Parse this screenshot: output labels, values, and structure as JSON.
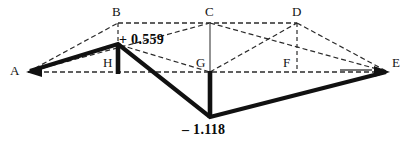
{
  "figure": {
    "width": 410,
    "height": 148,
    "background": "#ffffff",
    "stroke_solid_heavy": "#111111",
    "stroke_solid_thin": "#6f6f6f",
    "stroke_dashed": "#2b2b2b"
  },
  "nodes": [
    {
      "id": "A",
      "label": "A",
      "x": 28,
      "y": 72,
      "label_x": 10,
      "label_y": 64
    },
    {
      "id": "B",
      "label": "B",
      "x": 118,
      "y": 23,
      "label_x": 112,
      "label_y": 5
    },
    {
      "id": "C",
      "label": "C",
      "x": 210,
      "y": 23,
      "label_x": 205,
      "label_y": 5
    },
    {
      "id": "D",
      "label": "D",
      "x": 297,
      "y": 23,
      "label_x": 292,
      "label_y": 5
    },
    {
      "id": "E",
      "label": "E",
      "x": 388,
      "y": 72,
      "label_x": 392,
      "label_y": 56
    },
    {
      "id": "F",
      "label": "F",
      "x": 297,
      "y": 72,
      "label_x": 283,
      "label_y": 56
    },
    {
      "id": "G",
      "label": "G",
      "x": 210,
      "y": 72,
      "label_x": 196,
      "label_y": 56
    },
    {
      "id": "H",
      "label": "H",
      "x": 118,
      "y": 72,
      "label_x": 103,
      "label_y": 56
    }
  ],
  "ordinates": [
    {
      "id": "peak-positive",
      "text": "+ 0.559",
      "value": 0.559,
      "at_node": "H",
      "x": 118,
      "y": 44,
      "label_x": 119,
      "label_y": 33
    },
    {
      "id": "peak-negative",
      "text": "– 1.118",
      "value": -1.118,
      "at_node": "G",
      "x": 210,
      "y": 118,
      "label_x": 182,
      "label_y": 123
    }
  ],
  "series": {
    "influence_line": {
      "name": "influence line",
      "style": "solid-heavy",
      "points": [
        [
          28,
          72
        ],
        [
          118,
          44
        ],
        [
          210,
          118
        ],
        [
          388,
          72
        ]
      ]
    },
    "vertical_bars": [
      {
        "name": "bar-at-H",
        "x": 118,
        "y1": 44,
        "y2": 73
      },
      {
        "name": "bar-at-G",
        "x": 210,
        "y1": 72,
        "y2": 118
      }
    ],
    "baseline": {
      "name": "baseline-A-E",
      "style": "dashed",
      "points": [
        [
          28,
          72
        ],
        [
          388,
          72
        ]
      ]
    },
    "top_chord": {
      "name": "chord-B-C-D",
      "style": "dashed",
      "points": [
        [
          118,
          23
        ],
        [
          297,
          23
        ]
      ]
    },
    "construction_lines": [
      {
        "name": "A-B",
        "style": "dashed",
        "points": [
          [
            28,
            72
          ],
          [
            118,
            23
          ]
        ]
      },
      {
        "name": "B-H",
        "style": "dashed",
        "points": [
          [
            118,
            23
          ],
          [
            118,
            44
          ]
        ]
      },
      {
        "name": "A-C",
        "style": "dashed",
        "points": [
          [
            28,
            72
          ],
          [
            210,
            23
          ]
        ]
      },
      {
        "name": "C-G",
        "style": "solid-thin",
        "points": [
          [
            210,
            23
          ],
          [
            210,
            72
          ]
        ]
      },
      {
        "name": "C-E",
        "style": "dashed",
        "points": [
          [
            210,
            23
          ],
          [
            388,
            72
          ]
        ]
      },
      {
        "name": "H-G-slope",
        "style": "dashed",
        "points": [
          [
            118,
            44
          ],
          [
            210,
            72
          ]
        ]
      },
      {
        "name": "G-D",
        "style": "dashed",
        "points": [
          [
            210,
            72
          ],
          [
            297,
            23
          ]
        ]
      },
      {
        "name": "D-F",
        "style": "dashed",
        "points": [
          [
            297,
            23
          ],
          [
            297,
            72
          ]
        ]
      },
      {
        "name": "D-E",
        "style": "dashed",
        "points": [
          [
            297,
            23
          ],
          [
            388,
            72
          ]
        ]
      },
      {
        "name": "tick-near-E",
        "style": "solid-thin",
        "points": [
          [
            340,
            70
          ],
          [
            372,
            70
          ]
        ]
      }
    ],
    "arrowheads": [
      {
        "name": "arrow-at-A",
        "x": 28,
        "y": 72,
        "direction": "left"
      },
      {
        "name": "arrow-at-E",
        "x": 388,
        "y": 72,
        "direction": "right"
      }
    ]
  }
}
